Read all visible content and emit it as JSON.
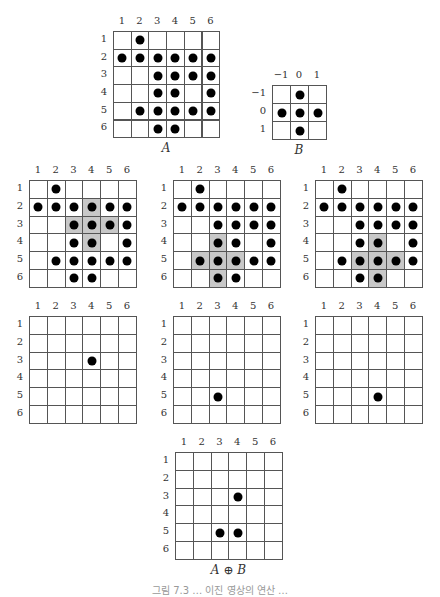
{
  "chart_data": {
    "type": "diagram",
    "grids": [
      {
        "id": "A",
        "caption": "A",
        "rows": 6,
        "cols": 6,
        "col_labels": [
          "1",
          "2",
          "3",
          "4",
          "5",
          "6"
        ],
        "row_labels": [
          "1",
          "2",
          "3",
          "4",
          "5",
          "6"
        ],
        "x": 113,
        "y": 31,
        "cell": 17.7,
        "dots": [
          [
            1,
            2
          ],
          [
            2,
            1
          ],
          [
            2,
            2
          ],
          [
            2,
            3
          ],
          [
            2,
            4
          ],
          [
            2,
            5
          ],
          [
            2,
            6
          ],
          [
            3,
            3
          ],
          [
            3,
            4
          ],
          [
            3,
            5
          ],
          [
            3,
            6
          ],
          [
            4,
            3
          ],
          [
            4,
            4
          ],
          [
            4,
            6
          ],
          [
            5,
            2
          ],
          [
            5,
            3
          ],
          [
            5,
            4
          ],
          [
            5,
            5
          ],
          [
            5,
            6
          ],
          [
            6,
            3
          ],
          [
            6,
            4
          ]
        ],
        "shaded": []
      },
      {
        "id": "B",
        "caption": "B",
        "rows": 3,
        "cols": 3,
        "col_labels": [
          "−1",
          "0",
          "1"
        ],
        "row_labels": [
          "−1",
          "0",
          "1"
        ],
        "x": 272,
        "y": 85,
        "cell": 18,
        "dots": [
          [
            1,
            2
          ],
          [
            2,
            1
          ],
          [
            2,
            2
          ],
          [
            2,
            3
          ],
          [
            3,
            2
          ]
        ],
        "shaded": []
      },
      {
        "id": "probe-1",
        "caption": "",
        "rows": 6,
        "cols": 6,
        "col_labels": [
          "1",
          "2",
          "3",
          "4",
          "5",
          "6"
        ],
        "row_labels": [
          "1",
          "2",
          "3",
          "4",
          "5",
          "6"
        ],
        "x": 29,
        "y": 180,
        "cell": 17.8,
        "dots": [
          [
            1,
            2
          ],
          [
            2,
            1
          ],
          [
            2,
            2
          ],
          [
            2,
            3
          ],
          [
            2,
            4
          ],
          [
            2,
            5
          ],
          [
            2,
            6
          ],
          [
            3,
            3
          ],
          [
            3,
            4
          ],
          [
            3,
            5
          ],
          [
            3,
            6
          ],
          [
            4,
            3
          ],
          [
            4,
            4
          ],
          [
            4,
            6
          ],
          [
            5,
            2
          ],
          [
            5,
            3
          ],
          [
            5,
            4
          ],
          [
            5,
            5
          ],
          [
            5,
            6
          ],
          [
            6,
            3
          ],
          [
            6,
            4
          ]
        ],
        "shaded": [
          [
            2,
            4
          ],
          [
            3,
            3
          ],
          [
            3,
            4
          ],
          [
            3,
            5
          ],
          [
            4,
            4
          ]
        ]
      },
      {
        "id": "probe-2",
        "caption": "",
        "rows": 6,
        "cols": 6,
        "col_labels": [
          "1",
          "2",
          "3",
          "4",
          "5",
          "6"
        ],
        "row_labels": [
          "1",
          "2",
          "3",
          "4",
          "5",
          "6"
        ],
        "x": 173,
        "y": 180,
        "cell": 17.8,
        "dots": [
          [
            1,
            2
          ],
          [
            2,
            1
          ],
          [
            2,
            2
          ],
          [
            2,
            3
          ],
          [
            2,
            4
          ],
          [
            2,
            5
          ],
          [
            2,
            6
          ],
          [
            3,
            3
          ],
          [
            3,
            4
          ],
          [
            3,
            5
          ],
          [
            3,
            6
          ],
          [
            4,
            3
          ],
          [
            4,
            4
          ],
          [
            4,
            6
          ],
          [
            5,
            2
          ],
          [
            5,
            3
          ],
          [
            5,
            4
          ],
          [
            5,
            5
          ],
          [
            5,
            6
          ],
          [
            6,
            3
          ],
          [
            6,
            4
          ]
        ],
        "shaded": [
          [
            4,
            3
          ],
          [
            5,
            2
          ],
          [
            5,
            3
          ],
          [
            5,
            4
          ],
          [
            6,
            3
          ]
        ]
      },
      {
        "id": "probe-3",
        "caption": "",
        "rows": 6,
        "cols": 6,
        "col_labels": [
          "1",
          "2",
          "3",
          "4",
          "5",
          "6"
        ],
        "row_labels": [
          "1",
          "2",
          "3",
          "4",
          "5",
          "6"
        ],
        "x": 315,
        "y": 180,
        "cell": 17.8,
        "dots": [
          [
            1,
            2
          ],
          [
            2,
            1
          ],
          [
            2,
            2
          ],
          [
            2,
            3
          ],
          [
            2,
            4
          ],
          [
            2,
            5
          ],
          [
            2,
            6
          ],
          [
            3,
            3
          ],
          [
            3,
            4
          ],
          [
            3,
            5
          ],
          [
            3,
            6
          ],
          [
            4,
            3
          ],
          [
            4,
            4
          ],
          [
            4,
            6
          ],
          [
            5,
            2
          ],
          [
            5,
            3
          ],
          [
            5,
            4
          ],
          [
            5,
            5
          ],
          [
            5,
            6
          ],
          [
            6,
            3
          ],
          [
            6,
            4
          ]
        ],
        "shaded": [
          [
            4,
            4
          ],
          [
            5,
            3
          ],
          [
            5,
            4
          ],
          [
            5,
            5
          ],
          [
            6,
            4
          ]
        ]
      },
      {
        "id": "result-1",
        "caption": "",
        "rows": 6,
        "cols": 6,
        "col_labels": [
          "1",
          "2",
          "3",
          "4",
          "5",
          "6"
        ],
        "row_labels": [
          "1",
          "2",
          "3",
          "4",
          "5",
          "6"
        ],
        "x": 29,
        "y": 316,
        "cell": 17.8,
        "dots": [
          [
            3,
            4
          ]
        ],
        "shaded": []
      },
      {
        "id": "result-2",
        "caption": "",
        "rows": 6,
        "cols": 6,
        "col_labels": [
          "1",
          "2",
          "3",
          "4",
          "5",
          "6"
        ],
        "row_labels": [
          "1",
          "2",
          "3",
          "4",
          "5",
          "6"
        ],
        "x": 173,
        "y": 316,
        "cell": 17.8,
        "dots": [
          [
            5,
            3
          ]
        ],
        "shaded": []
      },
      {
        "id": "result-3",
        "caption": "",
        "rows": 6,
        "cols": 6,
        "col_labels": [
          "1",
          "2",
          "3",
          "4",
          "5",
          "6"
        ],
        "row_labels": [
          "1",
          "2",
          "3",
          "4",
          "5",
          "6"
        ],
        "x": 315,
        "y": 316,
        "cell": 17.8,
        "dots": [
          [
            5,
            4
          ]
        ],
        "shaded": []
      },
      {
        "id": "A-op-B",
        "caption": "A ⊕ B",
        "rows": 6,
        "cols": 6,
        "col_labels": [
          "1",
          "2",
          "3",
          "4",
          "5",
          "6"
        ],
        "row_labels": [
          "1",
          "2",
          "3",
          "4",
          "5",
          "6"
        ],
        "x": 175,
        "y": 452,
        "cell": 17.8,
        "dots": [
          [
            3,
            4
          ],
          [
            5,
            3
          ],
          [
            5,
            4
          ]
        ],
        "shaded": []
      }
    ]
  },
  "figure_caption": "그림 7.3 … 이진 영상의 연산 …"
}
